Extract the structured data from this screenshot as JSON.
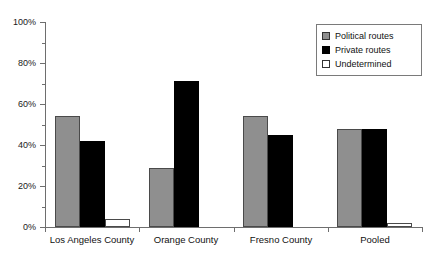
{
  "chart_data": {
    "type": "bar",
    "title": "",
    "xlabel": "",
    "ylabel": "",
    "categories": [
      "Los Angeles County",
      "Orange County",
      "Fresno County",
      "Pooled"
    ],
    "series": [
      {
        "name": "Political routes",
        "color": "#8f8f8f",
        "values": [
          54,
          29,
          54,
          48
        ]
      },
      {
        "name": "Private routes",
        "color": "#000000",
        "values": [
          42,
          71,
          45,
          48
        ]
      },
      {
        "name": "Undetermined",
        "color": "#ffffff",
        "values": [
          4,
          0,
          0,
          2
        ]
      }
    ],
    "ylim": [
      0,
      100
    ],
    "ytick_labels": [
      "0%",
      "20%",
      "40%",
      "60%",
      "80%",
      "100%"
    ],
    "ytick_values": [
      0,
      20,
      40,
      60,
      80,
      100
    ],
    "yminor_values": [
      10,
      30,
      50,
      70,
      90
    ],
    "grid": false,
    "legend_position": "top-right"
  },
  "legend": {
    "entries": [
      {
        "label": "Political routes",
        "swatch": "political"
      },
      {
        "label": "Private routes",
        "swatch": "private"
      },
      {
        "label": "Undetermined",
        "swatch": "undetermined"
      }
    ]
  }
}
